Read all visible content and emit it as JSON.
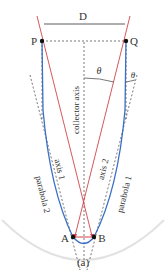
{
  "diagram": {
    "caption": "(a)",
    "width_label": "D",
    "points": {
      "P": "P",
      "Q": "Q",
      "A": "A",
      "B": "B"
    },
    "angle_labels": {
      "theta_center": "θ",
      "theta_edge": "θ"
    },
    "axis_labels": {
      "collector_axis": "collector axis",
      "axis1": "axis 1",
      "axis2": "axis 2"
    },
    "curve_labels": {
      "parabola1": "parabola 1",
      "parabola2": "parabola 2"
    },
    "colors": {
      "parabola": "#3a6fc4",
      "rays": "#d0454a",
      "dashed": "#555555",
      "outer_arc": "#e2e2e2",
      "points": "#111111"
    }
  }
}
